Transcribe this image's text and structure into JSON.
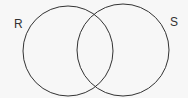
{
  "diagram": {
    "type": "venn",
    "sets": [
      {
        "label": "R",
        "cx": 68,
        "cy": 51,
        "r": 45
      },
      {
        "label": "S",
        "cx": 123,
        "cy": 50,
        "r": 46
      }
    ],
    "stroke_color": "#333333",
    "background": "#f7f7f7"
  }
}
